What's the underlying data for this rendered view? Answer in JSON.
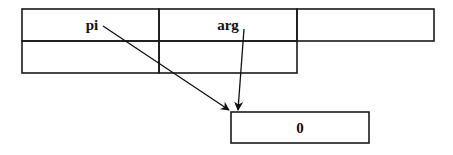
{
  "diagram": {
    "table": {
      "rows": [
        [
          "pi",
          "arg",
          ""
        ],
        [
          "",
          ""
        ]
      ]
    },
    "target_box": {
      "label": "0"
    },
    "arrows": [
      {
        "from": "pi",
        "to": "0"
      },
      {
        "from": "arg",
        "to": "0"
      }
    ],
    "colors": {
      "line": "#1a1a1a",
      "background": "#ffffff"
    }
  }
}
